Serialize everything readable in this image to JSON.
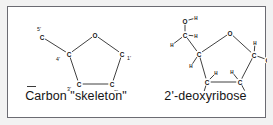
{
  "figure": {
    "background_color": "#ffffff",
    "margin_color": "#f2f2f2",
    "border_color": "#6b6b72",
    "ink_color": "#141414",
    "bond_color": "#2b2b2b"
  },
  "panels": [
    {
      "id": "carbon-skeleton",
      "caption": "Carbon \"skeleton\"",
      "description": "Furanose ring carbon skeleton of deoxyribose with primed carbon numbering",
      "atoms": [
        {
          "id": "O4",
          "element": "O",
          "x": 73,
          "y": 20,
          "label": "O",
          "number": ""
        },
        {
          "id": "C4p",
          "element": "C",
          "x": 47,
          "y": 39,
          "label": "C",
          "number": "4'",
          "number_dx": -11,
          "number_dy": 5
        },
        {
          "id": "C1p",
          "element": "C",
          "x": 100,
          "y": 39,
          "label": "C",
          "number": "1'",
          "number_dx": 7,
          "number_dy": 4
        },
        {
          "id": "C3p",
          "element": "C",
          "x": 57,
          "y": 69,
          "label": "C",
          "number": "3'",
          "number_dx": -10,
          "number_dy": 5
        },
        {
          "id": "C2p",
          "element": "C",
          "x": 90,
          "y": 69,
          "label": "C",
          "number": "2'",
          "number_dx": 4,
          "number_dy": 8
        },
        {
          "id": "C5p",
          "element": "C",
          "x": 20,
          "y": 22,
          "label": "C",
          "number": "5'",
          "number_dx": -3,
          "number_dy": -8
        }
      ],
      "bonds": [
        {
          "from": "O4",
          "to": "C4p"
        },
        {
          "from": "O4",
          "to": "C1p"
        },
        {
          "from": "C4p",
          "to": "C3p"
        },
        {
          "from": "C1p",
          "to": "C2p"
        },
        {
          "from": "C3p",
          "to": "C2p"
        },
        {
          "from": "C4p",
          "to": "C5p"
        }
      ]
    },
    {
      "id": "deoxyribose",
      "caption": "2'-deoxyribose",
      "description": "2'-deoxyribose shown with hydrogen and hydroxyl substituents",
      "atoms": [
        {
          "id": "O4",
          "element": "O",
          "x": 72,
          "y": 18,
          "label": "O"
        },
        {
          "id": "C4p",
          "element": "C",
          "x": 41,
          "y": 39,
          "label": "C"
        },
        {
          "id": "C1p",
          "element": "C",
          "x": 96,
          "y": 40,
          "label": "C"
        },
        {
          "id": "C3p",
          "element": "C",
          "x": 49,
          "y": 67,
          "label": "C"
        },
        {
          "id": "C2p",
          "element": "C",
          "x": 82,
          "y": 67,
          "label": "C"
        },
        {
          "id": "C5p",
          "element": "C",
          "x": 27,
          "y": 20,
          "label": "C"
        },
        {
          "id": "O5p",
          "element": "O",
          "x": 27,
          "y": 6,
          "label": "O"
        },
        {
          "id": "H5O",
          "element": "H",
          "x": 38,
          "y": 3,
          "label": "H",
          "size": "small"
        },
        {
          "id": "H5a",
          "element": "H",
          "x": 38,
          "y": 21,
          "label": "H",
          "size": "small"
        },
        {
          "id": "H5b",
          "element": "H",
          "x": 14,
          "y": 30,
          "label": "H",
          "size": "small"
        },
        {
          "id": "H4",
          "element": "H",
          "x": 33,
          "y": 51,
          "label": "H",
          "size": "small"
        },
        {
          "id": "H1",
          "element": "H",
          "x": 97,
          "y": 28,
          "label": "H",
          "size": "small"
        },
        {
          "id": "O1p",
          "element": "O",
          "x": 110,
          "y": 45,
          "label": "O"
        },
        {
          "id": "H1O",
          "element": "H",
          "x": 118,
          "y": 45,
          "label": "H",
          "size": "small"
        },
        {
          "id": "H3",
          "element": "H",
          "x": 58,
          "y": 58,
          "label": "H",
          "size": "small"
        },
        {
          "id": "O3p",
          "element": "O",
          "x": 45,
          "y": 80,
          "label": "O"
        },
        {
          "id": "H3O",
          "element": "H",
          "x": 55,
          "y": 82,
          "label": "H",
          "size": "small"
        },
        {
          "id": "H2a",
          "element": "H",
          "x": 74,
          "y": 57,
          "label": "H",
          "size": "small"
        },
        {
          "id": "H2b",
          "element": "H",
          "x": 88,
          "y": 78,
          "label": "H",
          "size": "small"
        }
      ],
      "bonds": [
        {
          "from": "O4",
          "to": "C4p"
        },
        {
          "from": "O4",
          "to": "C1p"
        },
        {
          "from": "C4p",
          "to": "C3p"
        },
        {
          "from": "C1p",
          "to": "C2p"
        },
        {
          "from": "C3p",
          "to": "C2p"
        },
        {
          "from": "C4p",
          "to": "C5p"
        },
        {
          "from": "C5p",
          "to": "O5p"
        },
        {
          "from": "O5p",
          "to": "H5O"
        },
        {
          "from": "C5p",
          "to": "H5a"
        },
        {
          "from": "C5p",
          "to": "H5b"
        },
        {
          "from": "C4p",
          "to": "H4"
        },
        {
          "from": "C1p",
          "to": "H1"
        },
        {
          "from": "C1p",
          "to": "O1p"
        },
        {
          "from": "O1p",
          "to": "H1O"
        },
        {
          "from": "C3p",
          "to": "H3"
        },
        {
          "from": "C3p",
          "to": "O3p"
        },
        {
          "from": "O3p",
          "to": "H3O"
        },
        {
          "from": "C2p",
          "to": "H2a"
        },
        {
          "from": "C2p",
          "to": "H2b"
        }
      ]
    }
  ]
}
